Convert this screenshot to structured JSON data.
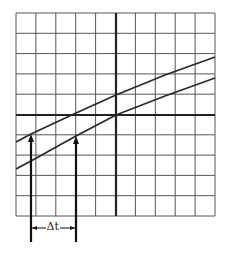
{
  "diagram": {
    "grid": {
      "left": 16,
      "top": 13,
      "right": 215,
      "bottom": 216,
      "columns": 10,
      "rows": 10
    },
    "axes": {
      "vertical_x": 116,
      "horizontal_y": 115
    },
    "curves": [
      {
        "name": "curve-upper",
        "points": [
          [
            16,
            142
          ],
          [
            31,
            134
          ],
          [
            76,
            113
          ],
          [
            116,
            95
          ],
          [
            165,
            75
          ],
          [
            215,
            57
          ]
        ]
      },
      {
        "name": "curve-lower",
        "points": [
          [
            16,
            169
          ],
          [
            31,
            161
          ],
          [
            76,
            136
          ],
          [
            116,
            115
          ],
          [
            165,
            96
          ],
          [
            215,
            78
          ]
        ]
      }
    ],
    "arrows": [
      {
        "name": "arrow-left",
        "x": 31,
        "y_from": 242,
        "y_to": 134
      },
      {
        "name": "arrow-right",
        "x": 76,
        "y_from": 242,
        "y_to": 136
      }
    ],
    "interval": {
      "label": "Δt",
      "y": 228,
      "x_from": 31,
      "x_to": 76
    },
    "colors": {
      "grid": "#555555",
      "axis": "#222222",
      "curve": "#2a2a2a",
      "arrow": "#111111"
    }
  }
}
